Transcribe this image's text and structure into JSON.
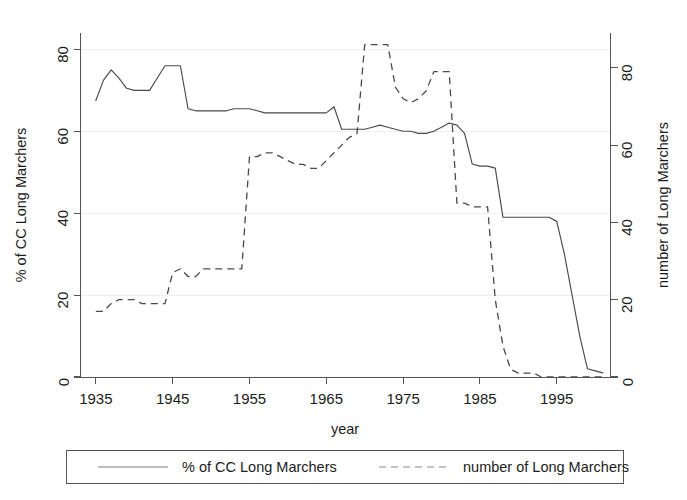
{
  "chart_data": {
    "type": "line",
    "title": "",
    "xlabel": "year",
    "ylabel": "% of CC Long Marchers",
    "y2label": "number of Long Marchers",
    "xlim": [
      1933,
      2002
    ],
    "ylim": [
      0,
      84
    ],
    "y2lim": [
      0,
      89
    ],
    "xticks": [
      1935,
      1945,
      1955,
      1965,
      1975,
      1985,
      1995
    ],
    "yticks": [
      0,
      20,
      40,
      60,
      80
    ],
    "y2ticks": [
      0,
      20,
      40,
      60,
      80
    ],
    "grid": "faint-horizontal",
    "legend_position": "bottom-outside",
    "series": [
      {
        "name": "% of CC Long Marchers",
        "axis": "left",
        "style": "solid",
        "x": [
          1935,
          1936,
          1937,
          1938,
          1939,
          1940,
          1941,
          1942,
          1943,
          1944,
          1945,
          1946,
          1947,
          1948,
          1949,
          1950,
          1951,
          1952,
          1953,
          1954,
          1955,
          1956,
          1957,
          1958,
          1959,
          1960,
          1961,
          1962,
          1963,
          1964,
          1965,
          1966,
          1967,
          1968,
          1969,
          1970,
          1971,
          1972,
          1973,
          1974,
          1975,
          1976,
          1977,
          1978,
          1979,
          1980,
          1981,
          1982,
          1983,
          1984,
          1985,
          1986,
          1987,
          1988,
          1989,
          1990,
          1991,
          1992,
          1993,
          1994,
          1995,
          1996,
          1997,
          1998,
          1999,
          2000,
          2001
        ],
        "y": [
          67.5,
          72.5,
          75.0,
          73.0,
          70.5,
          70.0,
          70.0,
          70.0,
          73.0,
          76.0,
          76.0,
          76.0,
          65.5,
          65.0,
          65.0,
          65.0,
          65.0,
          65.0,
          65.5,
          65.5,
          65.5,
          65.0,
          64.5,
          64.5,
          64.5,
          64.5,
          64.5,
          64.5,
          64.5,
          64.5,
          64.5,
          66.0,
          60.5,
          60.5,
          60.5,
          60.5,
          61.0,
          61.5,
          61.0,
          60.5,
          60.0,
          60.0,
          59.5,
          59.5,
          60.0,
          61.0,
          62.0,
          61.5,
          59.5,
          52.0,
          51.5,
          51.5,
          51.0,
          39.0,
          39.0,
          39.0,
          39.0,
          39.0,
          39.0,
          39.0,
          38.0,
          30.0,
          20.0,
          10.0,
          2.0,
          1.5,
          1.0
        ],
        "y_tail_note": "flat near 0 from 1993 to 2001"
      },
      {
        "name": "number of Long Marchers",
        "axis": "right",
        "style": "dashed",
        "x": [
          1935,
          1936,
          1937,
          1938,
          1939,
          1940,
          1941,
          1942,
          1943,
          1944,
          1945,
          1946,
          1947,
          1948,
          1949,
          1950,
          1951,
          1952,
          1953,
          1954,
          1955,
          1956,
          1957,
          1958,
          1959,
          1960,
          1961,
          1962,
          1963,
          1964,
          1965,
          1966,
          1967,
          1968,
          1969,
          1970,
          1971,
          1972,
          1973,
          1974,
          1975,
          1976,
          1977,
          1978,
          1979,
          1980,
          1981,
          1982,
          1983,
          1984,
          1985,
          1986,
          1987,
          1988,
          1989,
          1990,
          1991,
          1992,
          1993,
          1994,
          1995,
          1996,
          1997,
          1998,
          2001
        ],
        "y": [
          17,
          17,
          19,
          20,
          20,
          20,
          19,
          19,
          19,
          19,
          27,
          28,
          26,
          26,
          28,
          28,
          28,
          28,
          28,
          28,
          57,
          57,
          58,
          58,
          57,
          56,
          55,
          55,
          54,
          54,
          56,
          58,
          60,
          62,
          63,
          86,
          86,
          86,
          86,
          75,
          72,
          71,
          72,
          74,
          79,
          79,
          79,
          45,
          45,
          44,
          44,
          44,
          20,
          8,
          2,
          1,
          1,
          1,
          0,
          0,
          0,
          0,
          0,
          0,
          0
        ]
      }
    ]
  },
  "axes": {
    "left_title": "% of CC Long Marchers",
    "right_title": "number of Long Marchers",
    "x_title": "year",
    "x_ticklabels": [
      "1935",
      "1945",
      "1955",
      "1965",
      "1975",
      "1985",
      "1995"
    ],
    "y_ticklabels": [
      "0",
      "20",
      "40",
      "60",
      "80"
    ],
    "y2_ticklabels": [
      "0",
      "20",
      "40",
      "60",
      "80"
    ]
  },
  "legend": {
    "entries": [
      {
        "label": "% of CC Long Marchers",
        "style": "solid"
      },
      {
        "label": "number of Long Marchers",
        "style": "dashed"
      }
    ]
  },
  "colors": {
    "line": "#4a4a4a",
    "axis": "#555555",
    "grid": "#efefef",
    "background": "#ffffff",
    "text": "#1c1c1c"
  }
}
